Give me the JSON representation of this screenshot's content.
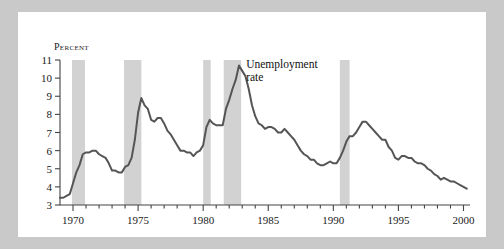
{
  "figure": {
    "background": "#ffffff",
    "frame_color": "#c9c9c9",
    "line_color": "#555555",
    "recession_band_color": "#d2d2d2"
  },
  "annotations": {
    "series_label_line1": "Unemployment",
    "series_label_line2": "rate"
  },
  "chart_data": {
    "type": "line",
    "title": "",
    "xlabel": "",
    "ylabel": "Percent",
    "ylim": [
      3,
      11
    ],
    "xlim": [
      1969,
      2000.5
    ],
    "grid": false,
    "legend": "none",
    "ytick_labels": [
      "3",
      "4",
      "5",
      "6",
      "7",
      "8",
      "9",
      "10",
      "11"
    ],
    "ytick_values": [
      3,
      4,
      5,
      6,
      7,
      8,
      9,
      10,
      11
    ],
    "xtick_labels": [
      "1970",
      "1975",
      "1980",
      "1985",
      "1990",
      "1995",
      "2000"
    ],
    "xtick_values": [
      1970,
      1975,
      1980,
      1985,
      1990,
      1995,
      2000
    ],
    "x_minor_step": 1,
    "series": [
      {
        "name": "Unemployment rate",
        "color": "#555555",
        "x": [
          1969.0,
          1969.25,
          1969.5,
          1969.75,
          1970.0,
          1970.25,
          1970.5,
          1970.75,
          1971.0,
          1971.25,
          1971.5,
          1971.75,
          1972.0,
          1972.25,
          1972.5,
          1972.75,
          1973.0,
          1973.25,
          1973.5,
          1973.75,
          1974.0,
          1974.25,
          1974.5,
          1974.75,
          1975.0,
          1975.25,
          1975.5,
          1975.75,
          1976.0,
          1976.25,
          1976.5,
          1976.75,
          1977.0,
          1977.25,
          1977.5,
          1977.75,
          1978.0,
          1978.25,
          1978.5,
          1978.75,
          1979.0,
          1979.25,
          1979.5,
          1979.75,
          1980.0,
          1980.25,
          1980.5,
          1980.75,
          1981.0,
          1981.25,
          1981.5,
          1981.75,
          1982.0,
          1982.25,
          1982.5,
          1982.75,
          1983.0,
          1983.25,
          1983.5,
          1983.75,
          1984.0,
          1984.25,
          1984.5,
          1984.75,
          1985.0,
          1985.25,
          1985.5,
          1985.75,
          1986.0,
          1986.25,
          1986.5,
          1986.75,
          1987.0,
          1987.25,
          1987.5,
          1987.75,
          1988.0,
          1988.25,
          1988.5,
          1988.75,
          1989.0,
          1989.25,
          1989.5,
          1989.75,
          1990.0,
          1990.25,
          1990.5,
          1990.75,
          1991.0,
          1991.25,
          1991.5,
          1991.75,
          1992.0,
          1992.25,
          1992.5,
          1992.75,
          1993.0,
          1993.25,
          1993.5,
          1993.75,
          1994.0,
          1994.25,
          1994.5,
          1994.75,
          1995.0,
          1995.25,
          1995.5,
          1995.75,
          1996.0,
          1996.25,
          1996.5,
          1996.75,
          1997.0,
          1997.25,
          1997.5,
          1997.75,
          1998.0,
          1998.25,
          1998.5,
          1998.75,
          1999.0,
          1999.25,
          1999.5,
          1999.75,
          2000.0,
          2000.25
        ],
        "y": [
          3.4,
          3.4,
          3.5,
          3.6,
          4.2,
          4.8,
          5.2,
          5.8,
          5.9,
          5.9,
          6.0,
          6.0,
          5.8,
          5.7,
          5.6,
          5.3,
          4.9,
          4.9,
          4.8,
          4.8,
          5.1,
          5.2,
          5.6,
          6.6,
          8.1,
          8.9,
          8.5,
          8.3,
          7.7,
          7.6,
          7.8,
          7.8,
          7.5,
          7.1,
          6.9,
          6.6,
          6.3,
          6.0,
          6.0,
          5.9,
          5.9,
          5.7,
          5.9,
          6.0,
          6.3,
          7.3,
          7.7,
          7.5,
          7.4,
          7.4,
          7.4,
          8.3,
          8.8,
          9.4,
          9.9,
          10.7,
          10.4,
          10.1,
          9.4,
          8.5,
          7.9,
          7.5,
          7.4,
          7.2,
          7.3,
          7.3,
          7.2,
          7.0,
          7.0,
          7.2,
          7.0,
          6.8,
          6.6,
          6.3,
          6.0,
          5.8,
          5.7,
          5.5,
          5.5,
          5.3,
          5.2,
          5.2,
          5.3,
          5.4,
          5.3,
          5.3,
          5.6,
          6.0,
          6.5,
          6.8,
          6.8,
          7.0,
          7.3,
          7.6,
          7.6,
          7.4,
          7.2,
          7.0,
          6.8,
          6.6,
          6.6,
          6.2,
          6.0,
          5.6,
          5.5,
          5.7,
          5.7,
          5.6,
          5.6,
          5.4,
          5.3,
          5.3,
          5.2,
          5.0,
          4.9,
          4.7,
          4.6,
          4.4,
          4.5,
          4.4,
          4.3,
          4.3,
          4.2,
          4.1,
          4.0,
          3.9
        ]
      }
    ],
    "recessions": [
      {
        "label": "1969-70",
        "start": 1969.92,
        "end": 1970.92
      },
      {
        "label": "1973-75",
        "start": 1973.92,
        "end": 1975.25
      },
      {
        "label": "1980",
        "start": 1980.0,
        "end": 1980.58
      },
      {
        "label": "1981-82",
        "start": 1981.58,
        "end": 1982.92
      },
      {
        "label": "1990-91",
        "start": 1990.5,
        "end": 1991.25
      }
    ]
  }
}
